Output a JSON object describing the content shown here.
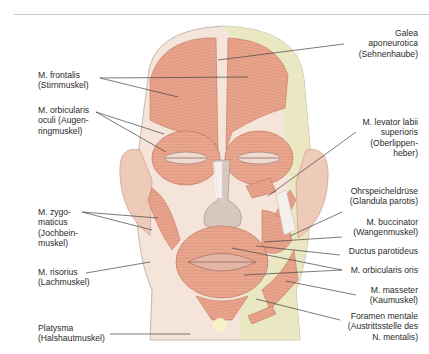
{
  "figure": {
    "colors": {
      "muscle": "#e8a48c",
      "muscle_dark": "#c97a62",
      "skin_yellow": "#e9e8bf",
      "skin": "#f3ddd0",
      "leader_line": "#444444",
      "text": "#2a2a2a"
    }
  },
  "labels_left": [
    {
      "id": "frontalis",
      "text": "M. frontalis\n(Stirnmuskel)"
    },
    {
      "id": "orbicularis-oculi",
      "text": "M. orbicularis\noculi (Augen-\nringmuskel)"
    },
    {
      "id": "zygomaticus",
      "text": "M. zygo-\nmaticus\n(Jochbein-\nmuskel)"
    },
    {
      "id": "risorius",
      "text": "M. risorius\n(Lachmuskel)"
    },
    {
      "id": "platysma",
      "text": "Platysma\n(Halshautmuskel)"
    }
  ],
  "labels_right": [
    {
      "id": "galea",
      "text": "Galea\naponeurotica\n(Sehnenhaube)"
    },
    {
      "id": "levator-labii",
      "text": "M. levator labii\nsuperioris\n(Oberlippen-\nheber)"
    },
    {
      "id": "parotis",
      "text": "Ohrspeicheldrüse\n(Glandula parotis)"
    },
    {
      "id": "buccinator",
      "text": "M. buccinator\n(Wangenmuskel)"
    },
    {
      "id": "ductus",
      "text": "Ductus parotideus"
    },
    {
      "id": "orbicularis-oris",
      "text": "M. orbicularis oris"
    },
    {
      "id": "masseter",
      "text": "M. masseter\n(Kaumuskel)"
    },
    {
      "id": "foramen",
      "text": "Foramen mentale\n(Austrittsstelle des\nN. mentalis)"
    }
  ]
}
